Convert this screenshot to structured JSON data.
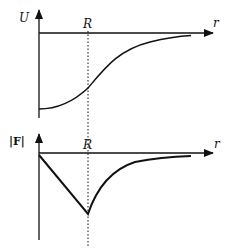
{
  "figure": {
    "top_plot": {
      "y_label": "U",
      "x_label": "r",
      "marker_label": "R",
      "curve": "potential energy rising from a minimum at r=0 toward zero, inflection at R"
    },
    "bottom_plot": {
      "y_label": "|F|",
      "x_label": "r",
      "marker_label": "R",
      "curve": "force magnitude decreasing linearly to a minimum at R then approaching zero as r increases"
    },
    "colors": {
      "ink": "#111111",
      "background": "#ffffff"
    }
  }
}
